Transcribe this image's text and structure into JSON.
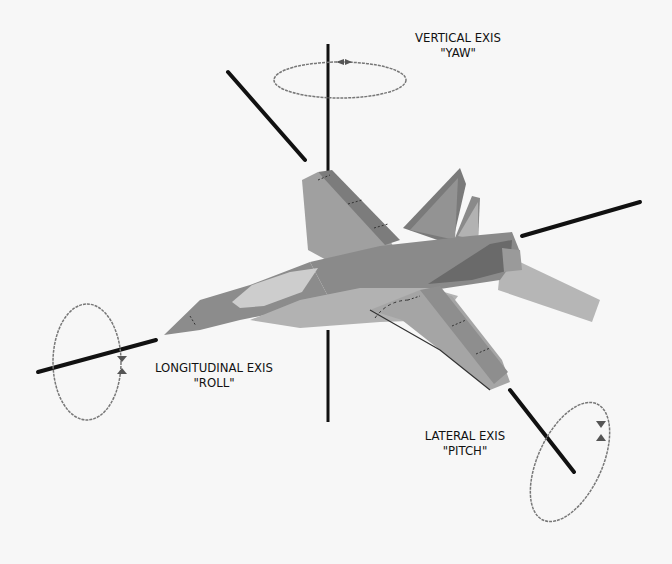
{
  "diagram": {
    "background": "#f7f7f7",
    "axes": [
      {
        "id": "vertical",
        "name": "VERTICAL EXIS",
        "motion": "\"YAW\""
      },
      {
        "id": "longitudinal",
        "name": "LONGITUDINAL EXIS",
        "motion": "\"ROLL\""
      },
      {
        "id": "lateral",
        "name": "LATERAL EXIS",
        "motion": "\"PITCH\""
      }
    ],
    "colors": {
      "axis_line": "#111111",
      "ellipse": "#777777",
      "aircraft_dark": "#6e6e6e",
      "aircraft_mid": "#8e8e8e",
      "aircraft_light": "#aaaaaa",
      "aircraft_pale": "#c4c4c4",
      "canopy": "#cfcfcf"
    }
  }
}
